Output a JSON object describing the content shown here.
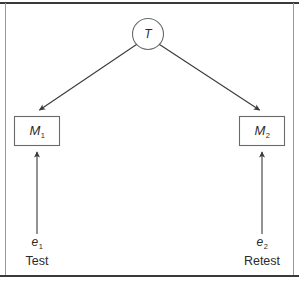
{
  "figure": {
    "type": "path-diagram",
    "background_color": "#ffffff",
    "stroke_color": "#3a3a3a",
    "text_color": "#2b2b2b",
    "border": {
      "top_rule": "visible",
      "bottom_rule": "visible",
      "left_rule": "visible",
      "right_rule": "visible"
    }
  },
  "nodes": {
    "latent": {
      "id": "T",
      "shape": "circle",
      "label": "T",
      "label_plain": "T"
    },
    "manifest_left": {
      "id": "M1",
      "shape": "rectangle",
      "label_base": "M",
      "label_sub": "1"
    },
    "manifest_right": {
      "id": "M2",
      "shape": "rectangle",
      "label_base": "M",
      "label_sub": "2"
    },
    "error_left": {
      "id": "e1",
      "shape": "none",
      "label_base": "e",
      "label_sub": "1"
    },
    "error_right": {
      "id": "e2",
      "shape": "none",
      "label_base": "e",
      "label_sub": "2"
    }
  },
  "occasion_labels": {
    "left": "Test",
    "right": "Retest"
  },
  "edges": [
    {
      "from": "T",
      "to": "M1",
      "kind": "directed",
      "style": "solid"
    },
    {
      "from": "T",
      "to": "M2",
      "kind": "directed",
      "style": "solid"
    },
    {
      "from": "e1",
      "to": "M1",
      "kind": "directed",
      "style": "solid"
    },
    {
      "from": "e2",
      "to": "M2",
      "kind": "directed",
      "style": "solid"
    }
  ]
}
